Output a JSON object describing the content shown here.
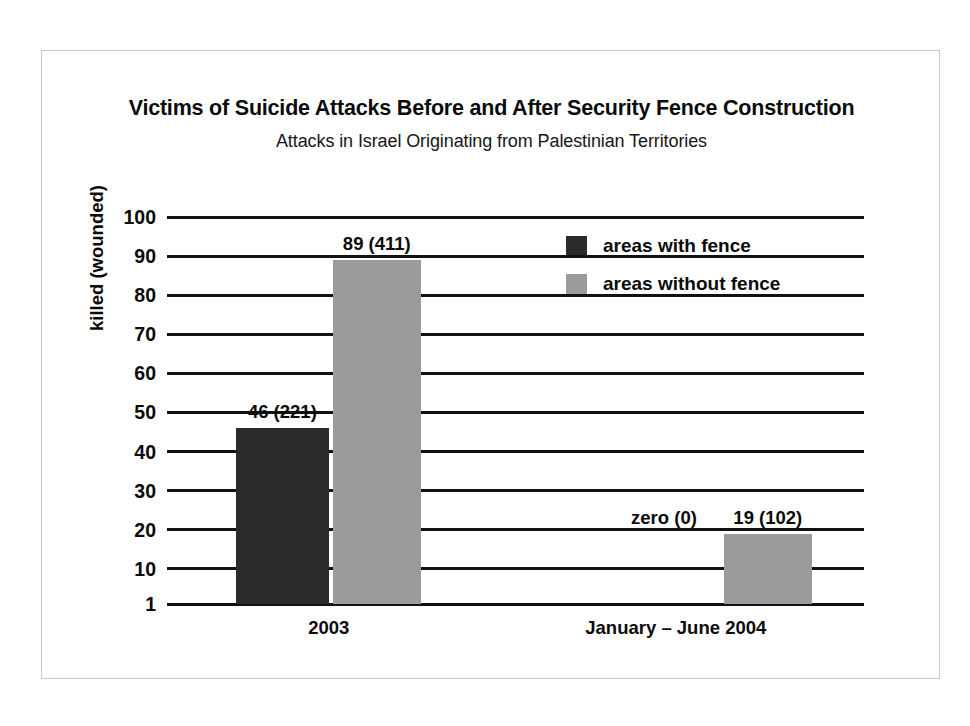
{
  "chart_data": {
    "type": "bar",
    "title": "Victims of Suicide Attacks Before and After Security Fence Construction",
    "subtitle": "Attacks in Israel Originating from Palestinian Territories",
    "xlabel": "",
    "ylabel": "killed (wounded)",
    "ylim": [
      1,
      100
    ],
    "grid": true,
    "legend_position": "top-right",
    "yticks": [
      100,
      90,
      80,
      70,
      60,
      50,
      40,
      30,
      20,
      10,
      1
    ],
    "ytick_labels": [
      "100",
      "90",
      "80",
      "70",
      "60",
      "50",
      "40",
      "30",
      "20",
      "10",
      "1"
    ],
    "categories": [
      "2003",
      "January – June 2004"
    ],
    "series": [
      {
        "name": "areas with fence",
        "color": "#2b2b2b",
        "values": [
          46,
          0
        ],
        "wounded": [
          221,
          0
        ],
        "labels": [
          "46 (221)",
          "zero (0)"
        ]
      },
      {
        "name": "areas without fence",
        "color": "#9b9b9b",
        "values": [
          89,
          19
        ],
        "wounded": [
          411,
          102
        ],
        "labels": [
          "89 (411)",
          "19 (102)"
        ]
      }
    ],
    "bars": [
      {
        "id": "bar-2003-with-fence",
        "category": "2003",
        "series": "areas with fence",
        "value": 46,
        "label": "46 (221)",
        "color": "#2b2b2b",
        "left_pct": 9.9,
        "width_pct": 13.3,
        "drawn": true
      },
      {
        "id": "bar-2003-without-fence",
        "category": "2003",
        "series": "areas without fence",
        "value": 89,
        "label": "89 (411)",
        "color": "#9b9b9b",
        "left_pct": 23.8,
        "width_pct": 12.6,
        "drawn": true
      },
      {
        "id": "bar-2004-with-fence",
        "category": "January – June 2004",
        "series": "areas with fence",
        "value": 0,
        "label": "zero (0)",
        "color": "#2b2b2b",
        "left_pct": 65.0,
        "width_pct": 12.6,
        "drawn": false
      },
      {
        "id": "bar-2004-without-fence",
        "category": "January – June 2004",
        "series": "areas without fence",
        "value": 19,
        "label": "19 (102)",
        "color": "#9b9b9b",
        "left_pct": 79.9,
        "width_pct": 12.6,
        "drawn": true
      }
    ]
  },
  "title": "Victims of Suicide Attacks Before and After Security Fence Construction",
  "subtitle": "Attacks in Israel Originating from Palestinian Territories",
  "axis": {
    "y_title": "killed (wounded)",
    "ticks": [
      "100",
      "90",
      "80",
      "70",
      "60",
      "50",
      "40",
      "30",
      "20",
      "10",
      "1"
    ]
  },
  "legend": {
    "items": [
      {
        "label": "areas with fence",
        "swatch": "dark"
      },
      {
        "label": "areas without fence",
        "swatch": "light"
      }
    ]
  },
  "categories": [
    {
      "label": "2003"
    },
    {
      "label": "January – June 2004"
    }
  ],
  "value_labels": [
    {
      "text": "46 (221)"
    },
    {
      "text": "89 (411)"
    },
    {
      "text": "zero (0)"
    },
    {
      "text": "19 (102)"
    }
  ],
  "colors": {
    "with_fence": "#2b2b2b",
    "without_fence": "#9b9b9b",
    "gridline": "#111111",
    "frame": "#c9c9c9",
    "background": "#ffffff"
  }
}
